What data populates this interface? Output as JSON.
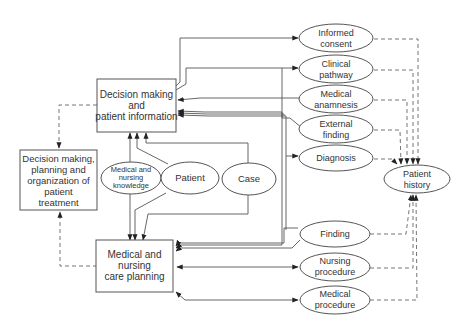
{
  "diagram": {
    "nodes": {
      "decision_info": {
        "shape": "box",
        "lines": [
          "Decision making",
          "and",
          "patient information"
        ]
      },
      "decision_planning": {
        "shape": "box",
        "lines": [
          "Decision making,",
          "planning and",
          "organization of",
          "patient",
          "treatment"
        ]
      },
      "care_planning": {
        "shape": "box",
        "lines": [
          "Medical and",
          "nursing",
          "care planning"
        ]
      },
      "knowledge": {
        "shape": "ellipse",
        "lines": [
          "Medical and",
          "nursing",
          "knowledge"
        ]
      },
      "patient": {
        "shape": "ellipse",
        "lines": [
          "Patient"
        ]
      },
      "case": {
        "shape": "ellipse",
        "lines": [
          "Case"
        ]
      },
      "informed_consent": {
        "shape": "ellipse",
        "lines": [
          "Informed",
          "consent"
        ]
      },
      "clinical_pathway": {
        "shape": "ellipse",
        "lines": [
          "Clinical",
          "pathway"
        ]
      },
      "medical_anamnesis": {
        "shape": "ellipse",
        "lines": [
          "Medical",
          "anamnesis"
        ]
      },
      "external_finding": {
        "shape": "ellipse",
        "lines": [
          "External",
          "finding"
        ]
      },
      "diagnosis": {
        "shape": "ellipse",
        "lines": [
          "Diagnosis"
        ]
      },
      "finding": {
        "shape": "ellipse",
        "lines": [
          "Finding"
        ]
      },
      "nursing_procedure": {
        "shape": "ellipse",
        "lines": [
          "Nursing",
          "procedure"
        ]
      },
      "medical_procedure": {
        "shape": "ellipse",
        "lines": [
          "Medical",
          "procedure"
        ]
      },
      "patient_history": {
        "shape": "ellipse",
        "lines": [
          "Patient",
          "history"
        ]
      }
    },
    "edges": [
      {
        "from": "decision_info",
        "to": "informed_consent",
        "style": "solid"
      },
      {
        "from": "decision_info",
        "to": "clinical_pathway",
        "style": "solid"
      },
      {
        "from": "medical_anamnesis",
        "to": "decision_info",
        "style": "solid"
      },
      {
        "from": "external_finding",
        "to": "decision_info",
        "style": "solid"
      },
      {
        "from": "diagnosis",
        "to": "decision_info",
        "style": "solid"
      },
      {
        "from": "finding",
        "to": "decision_info",
        "style": "solid"
      },
      {
        "from": "decision_info",
        "to": "diagnosis",
        "style": "solid"
      },
      {
        "from": "knowledge",
        "to": "decision_info",
        "style": "solid"
      },
      {
        "from": "patient",
        "to": "decision_info",
        "style": "solid"
      },
      {
        "from": "case",
        "to": "decision_info",
        "style": "solid"
      },
      {
        "from": "knowledge",
        "to": "care_planning",
        "style": "solid"
      },
      {
        "from": "patient",
        "to": "care_planning",
        "style": "solid"
      },
      {
        "from": "case",
        "to": "care_planning",
        "style": "solid"
      },
      {
        "from": "clinical_pathway",
        "to": "care_planning",
        "style": "solid"
      },
      {
        "from": "finding",
        "to": "care_planning",
        "style": "solid"
      },
      {
        "from": "care_planning",
        "to": "nursing_procedure",
        "style": "solid-bidirectional"
      },
      {
        "from": "care_planning",
        "to": "medical_procedure",
        "style": "solid-bidirectional"
      },
      {
        "from": "decision_info",
        "to": "decision_planning",
        "style": "dashed"
      },
      {
        "from": "care_planning",
        "to": "decision_planning",
        "style": "dashed"
      },
      {
        "from": "informed_consent",
        "to": "patient_history",
        "style": "dashed"
      },
      {
        "from": "clinical_pathway",
        "to": "patient_history",
        "style": "dashed"
      },
      {
        "from": "medical_anamnesis",
        "to": "patient_history",
        "style": "dashed"
      },
      {
        "from": "external_finding",
        "to": "patient_history",
        "style": "dashed"
      },
      {
        "from": "diagnosis",
        "to": "patient_history",
        "style": "dashed"
      },
      {
        "from": "finding",
        "to": "patient_history",
        "style": "dashed"
      },
      {
        "from": "nursing_procedure",
        "to": "patient_history",
        "style": "dashed"
      },
      {
        "from": "medical_procedure",
        "to": "patient_history",
        "style": "dashed"
      }
    ]
  }
}
